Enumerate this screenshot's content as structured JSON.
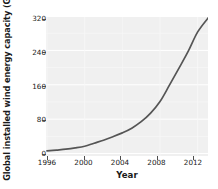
{
  "chart_data": {
    "type": "line",
    "title": "",
    "xlabel": "Year",
    "ylabel": "Global installed wind energy capacity (GW)",
    "xlim": [
      1996,
      2013.2
    ],
    "ylim": [
      0,
      320
    ],
    "xticks": [
      "1996",
      "2000",
      "2004",
      "2008",
      "2012"
    ],
    "xtick_values": [
      1996,
      2000,
      2004,
      2008,
      2012
    ],
    "yticks": [
      "0",
      "80",
      "160",
      "240",
      "320"
    ],
    "ytick_values": [
      0,
      80,
      160,
      240,
      320
    ],
    "grid": true,
    "legend": "none",
    "series": [
      {
        "name": "Global installed wind energy capacity",
        "color": "#555555",
        "x": [
          1996,
          1997,
          1998,
          1999,
          2000,
          2001,
          2002,
          2003,
          2004,
          2005,
          2006,
          2007,
          2008,
          2009,
          2010,
          2011,
          2012,
          2013.2
        ],
        "values": [
          6,
          8,
          10,
          13,
          17,
          24,
          31,
          39,
          48,
          59,
          74,
          94,
          121,
          159,
          198,
          238,
          283,
          318
        ]
      }
    ]
  },
  "axes": {
    "y_title": "Global installed wind energy capacity (GW)",
    "x_title": "Year",
    "ytick_labels": [
      "320",
      "240",
      "160",
      "80",
      "0"
    ],
    "xtick_labels": [
      "1996",
      "2000",
      "2004",
      "2008",
      "2012"
    ]
  },
  "colors": {
    "panel_background": "#f0f0f0",
    "grid": "#ffffff",
    "line": "#555555",
    "text": "#1a1a1a",
    "axis": "#4d4d4d"
  }
}
